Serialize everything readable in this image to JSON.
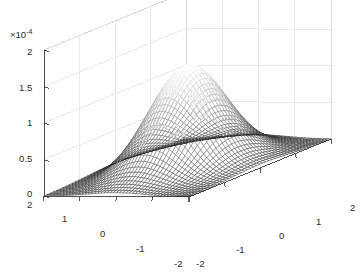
{
  "figure": {
    "background_color": "#ffffff",
    "axis_color": "#262626",
    "grid_color": "#e8e8e8",
    "box_edge_color": "#d9d9d9",
    "exponent_label": "×10",
    "exponent_power": "-4",
    "exponent_full": "×10⁻⁴"
  },
  "zaxis": {
    "name": "z-axis",
    "ticks": [
      "2",
      "1.5",
      "1",
      "0.5",
      "0"
    ],
    "values": [
      2,
      1.5,
      1,
      0.5,
      0
    ],
    "scale_factor": "1e-4",
    "limits": [
      0,
      2
    ]
  },
  "yaxis": {
    "name": "y-axis",
    "ticks": [
      "2",
      "1",
      "0",
      "-1",
      "-2"
    ],
    "values": [
      2,
      1,
      0,
      -1,
      -2
    ],
    "limits": [
      -2,
      2
    ]
  },
  "xaxis": {
    "name": "x-axis",
    "ticks": [
      "-2",
      "-1",
      "0",
      "1",
      "2"
    ],
    "values": [
      -2,
      -1,
      0,
      1,
      2
    ],
    "limits": [
      -2,
      2
    ]
  },
  "chart_data": {
    "type": "surface",
    "title": "",
    "xlabel": "",
    "ylabel": "",
    "zlabel": "",
    "subtitle": "",
    "annotations": [],
    "legend": [],
    "legend_position": "none",
    "grid": true,
    "colormap": "gray",
    "shading": "mesh",
    "z_scale": 0.0001,
    "z_exponent_text": "×10⁻⁴",
    "xlim": [
      -2,
      2
    ],
    "ylim": [
      -2,
      2
    ],
    "zlim": [
      0,
      2
    ],
    "xticks": [
      -2,
      -1,
      0,
      1,
      2
    ],
    "yticks": [
      -2,
      -1,
      0,
      1,
      2
    ],
    "zticks": [
      0,
      0.5,
      1,
      1.5,
      2
    ],
    "peak_value": 1.4,
    "peak_x": 0,
    "peak_y": 0,
    "sigma_x": 0.78,
    "sigma_y": 0.78,
    "grid_n": 46,
    "view_azimuth": -37.5,
    "view_elevation": 30
  },
  "ticklabels": {
    "z": [
      {
        "text": "2",
        "x": 27,
        "y": 47
      },
      {
        "text": "1.5",
        "x": 19,
        "y": 83
      },
      {
        "text": "1",
        "x": 27,
        "y": 118
      },
      {
        "text": "0.5",
        "x": 19,
        "y": 154
      },
      {
        "text": "0",
        "x": 27,
        "y": 189
      }
    ],
    "y": [
      {
        "text": "2",
        "x": 27,
        "y": 200
      },
      {
        "text": "1",
        "x": 62,
        "y": 214
      },
      {
        "text": "0",
        "x": 100,
        "y": 229
      },
      {
        "text": "-1",
        "x": 136,
        "y": 244
      },
      {
        "text": "-2",
        "x": 174,
        "y": 259
      }
    ],
    "x": [
      {
        "text": "-2",
        "x": 196,
        "y": 259
      },
      {
        "text": "-1",
        "x": 236,
        "y": 245
      },
      {
        "text": "0",
        "x": 279,
        "y": 231
      },
      {
        "text": "1",
        "x": 316,
        "y": 217
      },
      {
        "text": "2",
        "x": 350,
        "y": 203
      }
    ]
  }
}
